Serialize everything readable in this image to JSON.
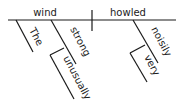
{
  "diagram": {
    "type": "sentence-diagram",
    "sentence": "The unusually strong wind howled very noisily.",
    "subject": {
      "word": "wind"
    },
    "predicate": {
      "word": "howled"
    },
    "modifiers": [
      {
        "id": "the",
        "word": "The",
        "modifies": "wind"
      },
      {
        "id": "strong",
        "word": "strong",
        "modifies": "wind"
      },
      {
        "id": "unusually",
        "word": "unusually",
        "modifies": "strong"
      },
      {
        "id": "noisily",
        "word": "noisily",
        "modifies": "howled"
      },
      {
        "id": "very",
        "word": "very",
        "modifies": "noisily"
      }
    ],
    "colors": {
      "ink": "#1a1a1a",
      "background": "#ffffff"
    }
  }
}
